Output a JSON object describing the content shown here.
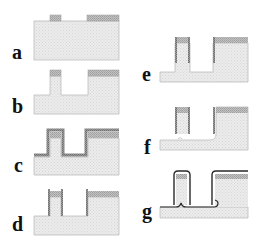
{
  "figure": {
    "type": "process-flow cross-section diagram",
    "panels": [
      {
        "id": "a",
        "label": "a",
        "description": "substrate with two hard-mask patches on top"
      },
      {
        "id": "b",
        "label": "b",
        "description": "anisotropic etch forms narrow pillar and wide block under masks"
      },
      {
        "id": "c",
        "label": "c",
        "description": "conformal coating deposited over all surfaces"
      },
      {
        "id": "d",
        "label": "d",
        "description": "coating removed from horizontal surfaces, sidewall spacers remain"
      },
      {
        "id": "e",
        "label": "e",
        "description": "further etch deepens trench below spacers"
      },
      {
        "id": "f",
        "label": "f",
        "description": "isotropic undercut etch releases pillar base"
      },
      {
        "id": "g",
        "label": "g",
        "description": "final conformal outline layer wrapping released structure"
      }
    ]
  },
  "colors": {
    "substrate": "#e9e9e9",
    "substrate_edge": "#b5b5b5",
    "mask": "#b9b9b9",
    "coating": "#8f8f8f",
    "outline": "#2a2a2a",
    "label": "#111111"
  }
}
